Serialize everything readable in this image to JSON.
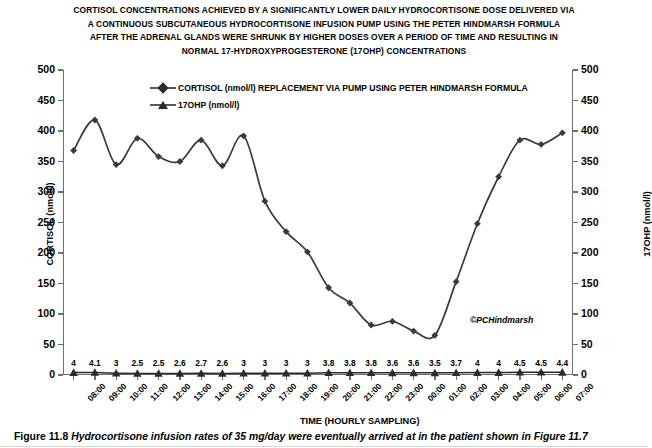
{
  "title": {
    "lines": [
      "CORTISOL CONCENTRATIONS ACHIEVED BY A SIGNIFICANTLY LOWER DAILY HYDROCORTISONE DOSE DELIVERED VIA",
      "A CONTINUOUS SUBCUTANEOUS HYDROCORTISONE INFUSION PUMP USING THE PETER HINDMARSH FORMULA",
      "AFTER THE ADRENAL GLANDS WERE SHRUNK BY HIGHER DOSES OVER A PERIOD OF TIME AND RESULTING IN",
      "NORMAL 17-HYDROXYPROGESTERONE (17OHP) CONCENTRATIONS"
    ]
  },
  "legend": {
    "items": [
      {
        "marker": "diamond-marker",
        "label": "CORTISOL (nmol/l) REPLACEMENT VIA PUMP USING PETER HINDMARSH FORMULA"
      },
      {
        "marker": "triangle-marker",
        "label": "17OHP (nmol/l)"
      }
    ]
  },
  "copyright": "©PCHindmarsh",
  "caption": {
    "number": "Figure 11.8",
    "text": "Hydrocortisone infusion rates of 35 mg/day were eventually arrived at in the patient shown in Figure 11.7"
  },
  "chart_data": {
    "type": "line",
    "xlabel": "TIME (HOURLY SAMPLING)",
    "ylabel": "CORTISOL (nmol/l)",
    "y2label": "17OHP (nmol/l)",
    "ylim": [
      0,
      500
    ],
    "y2lim": [
      0,
      500
    ],
    "yticks": [
      0,
      50,
      100,
      150,
      200,
      250,
      300,
      350,
      400,
      450,
      500
    ],
    "y2ticks": [
      0,
      50,
      100,
      150,
      200,
      250,
      300,
      350,
      400,
      450,
      500
    ],
    "grid": false,
    "legend_position": "top-center",
    "categories": [
      "08:00",
      "09:00",
      "10:00",
      "11:00",
      "12:00",
      "13:00",
      "14:00",
      "15:00",
      "16:00",
      "17:00",
      "18:00",
      "19:00",
      "20:00",
      "21:00",
      "22:00",
      "23:00",
      "00:00",
      "01:00",
      "02:00",
      "03:00",
      "04:00",
      "05:00",
      "06:00",
      "07:00"
    ],
    "series": [
      {
        "name": "CORTISOL (nmol/l) REPLACEMENT VIA PUMP USING PETER HINDMARSH FORMULA",
        "axis": "left",
        "marker": "diamond",
        "color": "#3a3a3a",
        "values": [
          368,
          418,
          345,
          388,
          358,
          350,
          385,
          343,
          392,
          285,
          235,
          202,
          143,
          118,
          82,
          88,
          72,
          65,
          153,
          248,
          325,
          385,
          378,
          397
        ]
      },
      {
        "name": "17OHP (nmol/l)",
        "axis": "right",
        "marker": "triangle",
        "color": "#2b2b2b",
        "values": [
          4,
          4.1,
          3,
          2.5,
          2.5,
          2.6,
          2.7,
          2.6,
          3,
          3,
          3,
          3,
          3.8,
          3.8,
          3.8,
          3.6,
          3.6,
          3.5,
          3.7,
          4,
          4,
          4.5,
          4.5,
          4.4
        ],
        "data_labels": [
          "4",
          "4.1",
          "3",
          "2.5",
          "2.5",
          "2.6",
          "2.7",
          "2.6",
          "3",
          "3",
          "3",
          "3",
          "3.8",
          "3.8",
          "3.8",
          "3.6",
          "3.6",
          "3.5",
          "3.7",
          "4",
          "4",
          "4.5",
          "4.5",
          "4.4"
        ]
      }
    ]
  }
}
